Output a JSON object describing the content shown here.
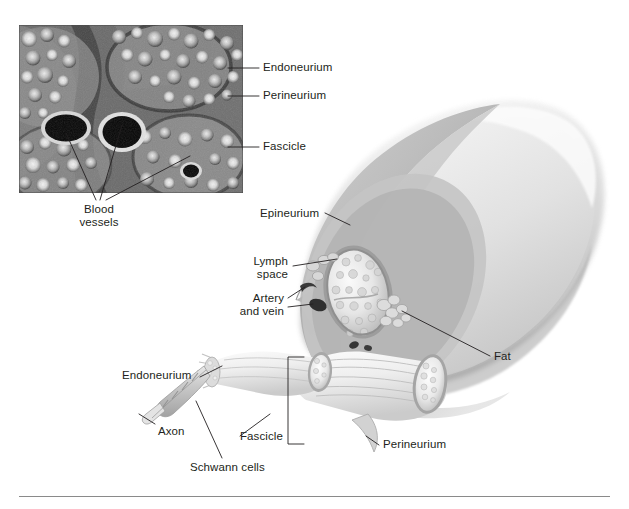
{
  "figure": {
    "top_bleed_text": "",
    "divider_color": "#8a8a8a",
    "background_color": "#ffffff",
    "text_color": "#231f20",
    "leader_line_color": "#231f20"
  },
  "micrograph": {
    "name": "peripheral-nerve-cross-section-micrograph",
    "x": 19,
    "y": 25,
    "width": 224,
    "height": 168,
    "description": "Light micrograph of peripheral nerve cross section showing fascicles, myelinated axons and blood vessels"
  },
  "micrograph_labels": [
    {
      "id": "endoneurium",
      "text": "Endoneurium",
      "x": 263,
      "y": 64,
      "align": "left"
    },
    {
      "id": "perineurium",
      "text": "Perineurium",
      "x": 263,
      "y": 92,
      "align": "left"
    },
    {
      "id": "fascicle",
      "text": "Fascicle",
      "x": 263,
      "y": 143,
      "align": "left"
    },
    {
      "id": "blood-vessels",
      "text": "Blood\nvessels",
      "x": 98,
      "y": 208,
      "align": "center"
    }
  ],
  "illustration_labels": [
    {
      "id": "epineurium",
      "text": "Epineurium",
      "x": 260,
      "y": 210,
      "align": "left"
    },
    {
      "id": "lymph-space",
      "text": "Lymph\nspace",
      "x": 230,
      "y": 258,
      "align": "right"
    },
    {
      "id": "artery-and-vein",
      "text": "Artery\nand vein",
      "x": 222,
      "y": 295,
      "align": "right"
    },
    {
      "id": "fat",
      "text": "Fat",
      "x": 494,
      "y": 353,
      "align": "left"
    },
    {
      "id": "endoneurium-2",
      "text": "Endoneurium",
      "x": 122,
      "y": 372,
      "align": "left"
    },
    {
      "id": "axon",
      "text": "Axon",
      "x": 158,
      "y": 427,
      "align": "left"
    },
    {
      "id": "fascicle-2",
      "text": "Fascicle",
      "x": 243,
      "y": 432,
      "align": "left"
    },
    {
      "id": "perineurium-2",
      "text": "Perineurium",
      "x": 383,
      "y": 441,
      "align": "left"
    },
    {
      "id": "schwann-cells",
      "text": "Schwann cells",
      "x": 190,
      "y": 463,
      "align": "left"
    }
  ],
  "anatomy_terms": [
    "Endoneurium",
    "Perineurium",
    "Fascicle",
    "Blood vessels",
    "Epineurium",
    "Lymph space",
    "Artery and vein",
    "Fat",
    "Axon",
    "Schwann cells"
  ],
  "palette": {
    "nerve_light": "#e9e9e9",
    "nerve_mid": "#cfcfcf",
    "nerve_dark": "#a8a8a8",
    "nerve_shadow": "#8c8c8c",
    "epineurium_fill": "#bdbdbd",
    "vessel_dark": "#3d3d3d",
    "fascicle_fill": "#f2f2f2"
  }
}
